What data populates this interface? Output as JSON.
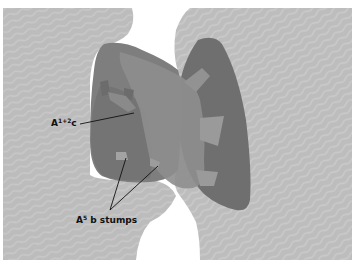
{
  "figure": {
    "type": "anatomical-illustration",
    "colors": {
      "background_tissue": "#bcbcbc",
      "tissue_stripe": "#c9c9c9",
      "left_lobe": "#7d7d7d",
      "left_lobe_dark": "#737373",
      "right_lobe": "#6f6f6f",
      "bronchus_band": "#8e8e8e",
      "stump": "#9b9b9b",
      "leader_line": "#111111",
      "page": "#ffffff"
    }
  },
  "labels": {
    "a12c": {
      "base": "A",
      "superscript": "1+2",
      "suffix": "c"
    },
    "a5b": {
      "base": "A",
      "superscript": "5",
      "suffix": " b stumps"
    }
  }
}
